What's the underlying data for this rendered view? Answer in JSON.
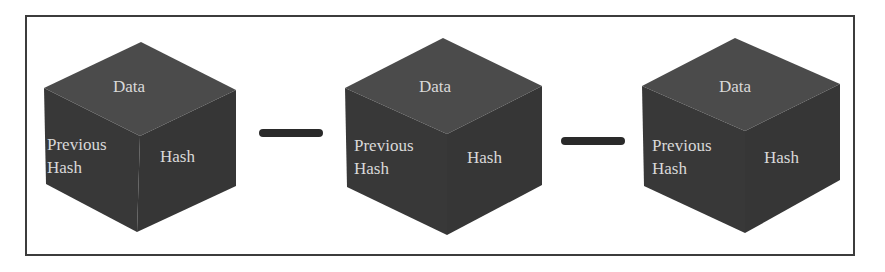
{
  "colors": {
    "frame": "#3c3c3c",
    "cube_top": "#4b4b4b",
    "cube_left": "#383838",
    "cube_right": "#363636",
    "connector": "#2a2a2a",
    "label": "#d9d9d9"
  },
  "blocks": [
    {
      "top_label": "Data",
      "left_label_line1": "Previous",
      "left_label_line2": "Hash",
      "right_label": "Hash"
    },
    {
      "top_label": "Data",
      "left_label_line1": "Previous",
      "left_label_line2": "Hash",
      "right_label": "Hash"
    },
    {
      "top_label": "Data",
      "left_label_line1": "Previous",
      "left_label_line2": "Hash",
      "right_label": "Hash"
    }
  ],
  "connectors": [
    {
      "from": 0,
      "to": 1
    },
    {
      "from": 1,
      "to": 2
    }
  ]
}
